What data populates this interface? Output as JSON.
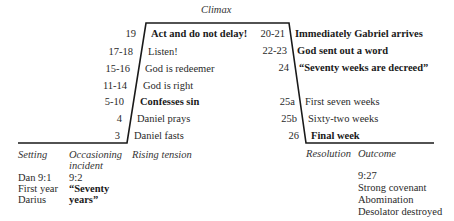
{
  "climax_label": "Climax",
  "rising": [
    {
      "verse": "19",
      "text": "Act and do not delay!",
      "bold": true
    },
    {
      "verse": "17-18",
      "text": "Listen!",
      "bold": false
    },
    {
      "verse": "15-16",
      "text": "God is redeemer",
      "bold": false
    },
    {
      "verse": "11-14",
      "text": "God is right",
      "bold": false
    },
    {
      "verse": "5-10",
      "text": "Confesses sin",
      "bold": true
    },
    {
      "verse": "4",
      "text": "Daniel prays",
      "bold": false
    },
    {
      "verse": "3",
      "text": "Daniel fasts",
      "bold": false
    }
  ],
  "falling": [
    {
      "verse": "20-21",
      "text": "Immediately Gabriel arrives",
      "bold": true
    },
    {
      "verse": "22-23",
      "text": "God sent out a word",
      "bold": true
    },
    {
      "verse": "24",
      "text": "“Seventy weeks are decreed”",
      "bold": true
    },
    {
      "verse": "25a",
      "text": "First seven weeks",
      "bold": false
    },
    {
      "verse": "25b",
      "text": "Sixty-two weeks",
      "bold": false
    },
    {
      "verse": "26",
      "text": "Final week",
      "bold": true
    }
  ],
  "stages": {
    "setting": "Setting",
    "occasioning_1": "Occasioning",
    "occasioning_2": "incident",
    "rising": "Rising tension",
    "resolution": "Resolution",
    "outcome": "Outcome"
  },
  "setting_details": [
    "Dan 9:1",
    "First year",
    "Darius"
  ],
  "occasioning_details": {
    "ref": "9:2",
    "line1": "“Seventy",
    "line2": "years”"
  },
  "outcome_details": [
    "9:27",
    "Strong covenant",
    "Abomination",
    "Desolator destroyed"
  ]
}
